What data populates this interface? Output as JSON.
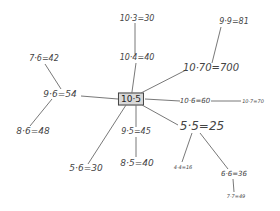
{
  "diagram": {
    "type": "mind-map",
    "center": {
      "label": "10·5",
      "x": 131,
      "y": 99,
      "size": 9
    },
    "nodes": [
      {
        "id": "n1",
        "label": "10·3=30",
        "x": 137,
        "y": 19,
        "size": 8
      },
      {
        "id": "n2",
        "label": "10·4=40",
        "x": 137,
        "y": 58,
        "size": 8
      },
      {
        "id": "n3",
        "label": "9·9=81",
        "x": 234,
        "y": 22,
        "size": 8
      },
      {
        "id": "n4",
        "label": "10·70=700",
        "x": 211,
        "y": 68,
        "size": 10
      },
      {
        "id": "n5",
        "label": "10·6=60",
        "x": 195,
        "y": 101,
        "size": 7
      },
      {
        "id": "n6",
        "label": "10·7=70",
        "x": 253,
        "y": 101,
        "size": 5
      },
      {
        "id": "n7",
        "label": "7·6=42",
        "x": 44,
        "y": 59,
        "size": 8
      },
      {
        "id": "n8",
        "label": "9·6=54",
        "x": 60,
        "y": 94,
        "size": 9
      },
      {
        "id": "n9",
        "label": "8·6=48",
        "x": 33,
        "y": 131,
        "size": 9
      },
      {
        "id": "n10",
        "label": "9·5=45",
        "x": 136,
        "y": 132,
        "size": 8
      },
      {
        "id": "n11",
        "label": "5·5=25",
        "x": 202,
        "y": 126,
        "size": 12
      },
      {
        "id": "n12",
        "label": "8·5=40",
        "x": 137,
        "y": 163,
        "size": 9
      },
      {
        "id": "n13",
        "label": "5·6=30",
        "x": 86,
        "y": 168,
        "size": 9
      },
      {
        "id": "n14",
        "label": "4·4=16",
        "x": 183,
        "y": 167,
        "size": 5
      },
      {
        "id": "n15",
        "label": "6·6=36",
        "x": 234,
        "y": 174,
        "size": 7
      },
      {
        "id": "n16",
        "label": "7·7=49",
        "x": 236,
        "y": 196,
        "size": 5
      }
    ],
    "edges": [
      {
        "x1": 131,
        "y1": 99,
        "x2": 136,
        "y2": 63
      },
      {
        "x1": 135,
        "y1": 54,
        "x2": 135,
        "y2": 23
      },
      {
        "x1": 141,
        "y1": 93,
        "x2": 186,
        "y2": 70
      },
      {
        "x1": 212,
        "y1": 63,
        "x2": 221,
        "y2": 27
      },
      {
        "x1": 145,
        "y1": 99,
        "x2": 180,
        "y2": 101
      },
      {
        "x1": 211,
        "y1": 101,
        "x2": 241,
        "y2": 101
      },
      {
        "x1": 118,
        "y1": 99,
        "x2": 81,
        "y2": 96
      },
      {
        "x1": 61,
        "y1": 89,
        "x2": 45,
        "y2": 64
      },
      {
        "x1": 52,
        "y1": 99,
        "x2": 30,
        "y2": 126
      },
      {
        "x1": 136,
        "y1": 105,
        "x2": 136,
        "y2": 127
      },
      {
        "x1": 136,
        "y1": 137,
        "x2": 136,
        "y2": 157
      },
      {
        "x1": 126,
        "y1": 105,
        "x2": 88,
        "y2": 164
      },
      {
        "x1": 142,
        "y1": 105,
        "x2": 178,
        "y2": 125
      },
      {
        "x1": 192,
        "y1": 133,
        "x2": 182,
        "y2": 162
      },
      {
        "x1": 200,
        "y1": 133,
        "x2": 228,
        "y2": 169
      },
      {
        "x1": 233,
        "y1": 179,
        "x2": 234,
        "y2": 192
      }
    ]
  }
}
